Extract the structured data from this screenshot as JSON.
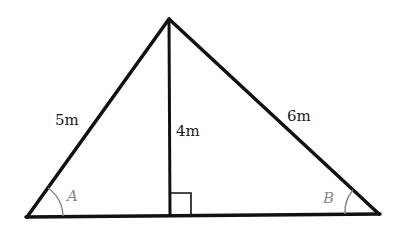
{
  "diagram": {
    "type": "triangle-with-altitude",
    "vertices": {
      "apex": [
        169,
        19
      ],
      "left": [
        27,
        217
      ],
      "right": [
        379,
        214
      ],
      "foot": [
        170,
        216
      ]
    },
    "colors": {
      "stroke": "#111111",
      "angle_marks": "#888888",
      "background": "#ffffff"
    },
    "labels": {
      "left_side": "5m",
      "altitude": "4m",
      "right_side": "6m",
      "angle_left": "A",
      "angle_right": "B"
    },
    "right_angle_marker": true
  }
}
